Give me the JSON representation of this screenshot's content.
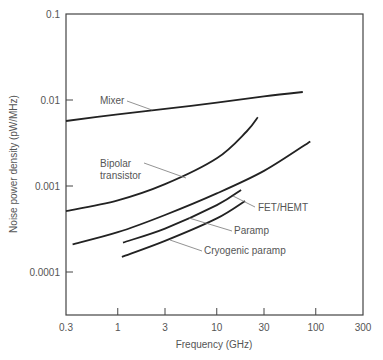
{
  "chart_data": {
    "type": "line",
    "title": "",
    "xlabel": "Frequency (GHz)",
    "ylabel": "Noise power density (pW/MHz)",
    "xscale": "log",
    "yscale": "log",
    "xlim": [
      0.3,
      300
    ],
    "ylim": [
      3e-05,
      0.1
    ],
    "xticks": [
      0.3,
      1,
      3,
      10,
      30,
      100,
      300
    ],
    "xtick_labels": [
      "0.3",
      "1",
      "3",
      "10",
      "30",
      "100",
      "300"
    ],
    "yticks": [
      0.1,
      0.01,
      0.001,
      0.0001
    ],
    "ytick_labels": [
      "0.1",
      "0.01",
      "0.001",
      "0.0001"
    ],
    "grid": false,
    "legend": "inline annotations with leader lines",
    "series": [
      {
        "name": "Mixer",
        "x": [
          0.3,
          1,
          3,
          10,
          30,
          74
        ],
        "y": [
          0.0057,
          0.0068,
          0.0079,
          0.0093,
          0.011,
          0.0124
        ]
      },
      {
        "name": "Bipolar transistor",
        "x": [
          0.3,
          1,
          3,
          10,
          20,
          26
        ],
        "y": [
          0.00051,
          0.00068,
          0.00105,
          0.0021,
          0.0043,
          0.0063
        ]
      },
      {
        "name": "FET/HEMT",
        "x": [
          0.35,
          1,
          3,
          10,
          30,
          88
        ],
        "y": [
          0.00021,
          0.00029,
          0.00046,
          0.00082,
          0.0015,
          0.0033
        ]
      },
      {
        "name": "Paramp",
        "x": [
          1.13,
          3,
          10,
          17.6
        ],
        "y": [
          0.00022,
          0.00032,
          0.0006,
          0.0009
        ]
      },
      {
        "name": "Cryogenic paramp",
        "x": [
          1.1,
          3,
          10,
          19.3
        ],
        "y": [
          0.00015,
          0.00023,
          0.00042,
          0.00067
        ]
      }
    ],
    "annotations": [
      {
        "text": "Mixer",
        "series": "Mixer"
      },
      {
        "text": "Bipolar",
        "text2": "transistor",
        "series": "Bipolar transistor"
      },
      {
        "text": "FET/HEMT",
        "series": "FET/HEMT"
      },
      {
        "text": "Paramp",
        "series": "Paramp"
      },
      {
        "text": "Cryogenic paramp",
        "series": "Cryogenic paramp"
      }
    ]
  }
}
